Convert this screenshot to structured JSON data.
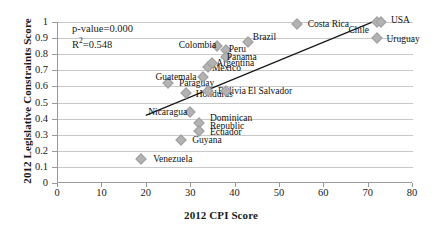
{
  "chart_data": {
    "type": "scatter",
    "title": "",
    "xlabel": "2012 CPI Score",
    "ylabel": "2012 Legislative Constraints Score",
    "xlim": [
      0,
      80
    ],
    "ylim": [
      0,
      1
    ],
    "xticks": [
      "0",
      "10",
      "20",
      "30",
      "40",
      "50",
      "60",
      "70",
      "80"
    ],
    "yticks": [
      "0",
      "0.1",
      "0.2",
      "0.3",
      "0.4",
      "0.5",
      "0.6",
      "0.7",
      "0.8",
      "0.9",
      "1"
    ],
    "grid": "horizontal",
    "legend": "none",
    "marker_color": "#b3b3b3",
    "trendline_color": "#1a1a1a",
    "annotations": {
      "p_value": "p-value=0.000",
      "r_squared_prefix": "R",
      "r_squared_sup": "2",
      "r_squared_value": "=0.548"
    },
    "trendline": {
      "x0": 20,
      "y0": 0.42,
      "x1": 72,
      "y1": 1.01
    },
    "points": [
      {
        "label": "Venezuela",
        "x": 19,
        "y": 0.15,
        "lx": 12,
        "ly": -4
      },
      {
        "label": "Paraguay",
        "x": 25,
        "y": 0.62,
        "lx": 11,
        "ly": -4
      },
      {
        "label": "Guyana",
        "x": 28,
        "y": 0.27,
        "lx": 11,
        "ly": -4
      },
      {
        "label": "Honduras",
        "x": 29,
        "y": 0.56,
        "lx": 10,
        "ly": -3
      },
      {
        "label": "Nicaragua",
        "x": 30,
        "y": 0.44,
        "lx": -42,
        "ly": -4
      },
      {
        "label": "Dominican",
        "x": 32,
        "y": 0.37,
        "lx": 11,
        "ly": -9
      },
      {
        "label": "Republic",
        "x": 32,
        "y": 0.37,
        "lx": 11,
        "ly": -1
      },
      {
        "label": "Ecuador",
        "x": 32,
        "y": 0.32,
        "lx": 11,
        "ly": -3
      },
      {
        "label": "Guatemala",
        "x": 33,
        "y": 0.66,
        "lx": -48,
        "ly": -4
      },
      {
        "label": "Bolivia",
        "x": 34,
        "y": 0.57,
        "lx": 10,
        "ly": -4
      },
      {
        "label": "Mexico",
        "x": 34,
        "y": 0.72,
        "lx": 4,
        "ly": -3
      },
      {
        "label": "Argentina",
        "x": 35,
        "y": 0.745,
        "lx": 4,
        "ly": -4
      },
      {
        "label": "Colombia",
        "x": 36,
        "y": 0.85,
        "lx": -38,
        "ly": -5
      },
      {
        "label": "Peru",
        "x": 38,
        "y": 0.825,
        "lx": 3,
        "ly": -5
      },
      {
        "label": "Panama",
        "x": 38,
        "y": 0.785,
        "lx": 1,
        "ly": -4
      },
      {
        "label": "El Salvador",
        "x": 38,
        "y": 0.57,
        "lx": 22,
        "ly": -4
      },
      {
        "label": "Brazil",
        "x": 43,
        "y": 0.875,
        "lx": 5,
        "ly": -9
      },
      {
        "label": "Costa Rica",
        "x": 54,
        "y": 0.99,
        "lx": 11,
        "ly": -4
      },
      {
        "label": "Chile",
        "x": 72,
        "y": 1.0,
        "lx": -28,
        "ly": 4
      },
      {
        "label": "USA",
        "x": 73,
        "y": 1.0,
        "lx": 10,
        "ly": -6
      },
      {
        "label": "Uruguay",
        "x": 72,
        "y": 0.9,
        "lx": 10,
        "ly": -3
      }
    ]
  }
}
